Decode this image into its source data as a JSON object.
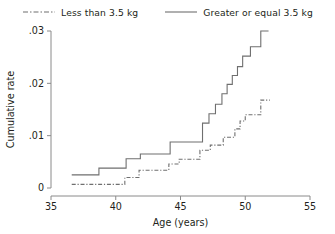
{
  "legend": {
    "entries": [
      {
        "label": "Less than 3.5 kg",
        "style": "dash-dot",
        "swatch": "dashed-line-swatch"
      },
      {
        "label": "Greater or equal 3.5 kg",
        "style": "solid",
        "swatch": "solid-line-swatch"
      }
    ]
  },
  "colors": {
    "line": "#6f6f6f",
    "axis": "#8a8a8a",
    "text": "#231f20",
    "background": "#ffffff"
  },
  "chart_data": {
    "type": "line",
    "subtype": "step-cumulative-incidence",
    "title": "",
    "subtitle": "",
    "xlabel": "Age (years)",
    "ylabel": "Cumulative rate",
    "xlim": [
      35,
      55
    ],
    "ylim": [
      0,
      0.03
    ],
    "xticks": [
      35,
      40,
      45,
      50,
      55
    ],
    "xtick_labels": [
      "35",
      "40",
      "45",
      "50",
      "55"
    ],
    "yticks": [
      0,
      0.01,
      0.02,
      0.03
    ],
    "ytick_labels": [
      "0",
      ".01",
      ".02",
      ".03"
    ],
    "grid": false,
    "legend_position": "top",
    "series": [
      {
        "name": "Greater or equal 3.5 kg",
        "style": "solid",
        "x": [
          36.6,
          38.7,
          38.7,
          40.8,
          40.8,
          41.9,
          41.9,
          44.2,
          44.2,
          46.7,
          46.7,
          47.2,
          47.2,
          47.7,
          47.7,
          48.2,
          48.2,
          48.6,
          48.6,
          49.0,
          49.0,
          49.4,
          49.4,
          49.8,
          49.8,
          50.4,
          50.4,
          51.2,
          51.2,
          51.8
        ],
        "y": [
          0.0025,
          0.0025,
          0.0038,
          0.0038,
          0.0056,
          0.0056,
          0.0065,
          0.0065,
          0.0088,
          0.0088,
          0.0124,
          0.0124,
          0.0142,
          0.0142,
          0.016,
          0.016,
          0.018,
          0.018,
          0.0198,
          0.0198,
          0.0215,
          0.0215,
          0.0232,
          0.0232,
          0.0252,
          0.0252,
          0.027,
          0.027,
          0.03,
          0.03
        ]
      },
      {
        "name": "Less than 3.5 kg",
        "style": "dash-dot",
        "x": [
          36.6,
          40.7,
          40.7,
          41.8,
          41.8,
          44.1,
          44.1,
          44.9,
          44.9,
          46.5,
          46.5,
          47.3,
          47.3,
          48.3,
          48.3,
          49.2,
          49.2,
          49.6,
          49.6,
          50.0,
          50.0,
          51.2,
          51.2,
          51.9
        ],
        "y": [
          0.0007,
          0.0007,
          0.002,
          0.002,
          0.0034,
          0.0034,
          0.0046,
          0.0046,
          0.0055,
          0.0055,
          0.0072,
          0.0072,
          0.0082,
          0.0082,
          0.0097,
          0.0097,
          0.0113,
          0.0113,
          0.0128,
          0.0128,
          0.014,
          0.014,
          0.0168,
          0.0168
        ]
      }
    ]
  }
}
